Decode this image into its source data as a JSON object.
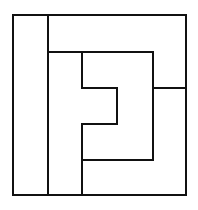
{
  "diagram": {
    "type": "tiling-puzzle",
    "stroke_color": "#111111",
    "background_color": "#ffffff",
    "stroke_width": 2,
    "outer_frame": {
      "x": 13,
      "y": 15,
      "width": 173,
      "height": 180
    },
    "segments": [
      {
        "id": "left-strip-divider",
        "x1": 48,
        "y1": 15,
        "x2": 48,
        "y2": 195
      },
      {
        "id": "top-band-bottom",
        "x1": 48,
        "y1": 52,
        "x2": 153,
        "y2": 52
      },
      {
        "id": "inner-right-vertical",
        "x1": 153,
        "y1": 52,
        "x2": 153,
        "y2": 160
      },
      {
        "id": "right-notch-horizontal",
        "x1": 153,
        "y1": 88,
        "x2": 186,
        "y2": 88
      },
      {
        "id": "second-strip-divider-upper",
        "x1": 82,
        "y1": 52,
        "x2": 82,
        "y2": 88
      },
      {
        "id": "notch-top",
        "x1": 82,
        "y1": 88,
        "x2": 117,
        "y2": 88
      },
      {
        "id": "notch-right",
        "x1": 117,
        "y1": 88,
        "x2": 117,
        "y2": 124
      },
      {
        "id": "notch-bottom",
        "x1": 82,
        "y1": 124,
        "x2": 117,
        "y2": 124
      },
      {
        "id": "second-strip-divider-lower",
        "x1": 82,
        "y1": 124,
        "x2": 82,
        "y2": 195
      },
      {
        "id": "inner-bottom",
        "x1": 82,
        "y1": 160,
        "x2": 153,
        "y2": 160
      }
    ],
    "regions": [
      {
        "id": "region-left-strip",
        "label": ""
      },
      {
        "id": "region-top-band",
        "label": ""
      },
      {
        "id": "region-second-strip",
        "label": ""
      },
      {
        "id": "region-inner-c-shape",
        "label": ""
      },
      {
        "id": "region-outer-j-shape",
        "label": ""
      }
    ]
  }
}
